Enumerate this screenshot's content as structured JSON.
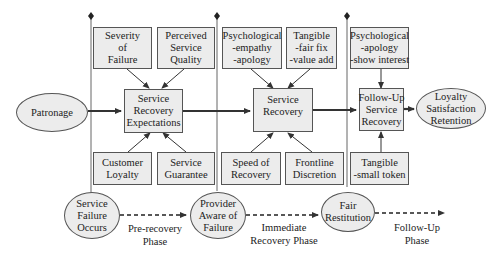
{
  "diagram": {
    "left_node": {
      "id": "patronage",
      "lines": [
        "Patronage"
      ]
    },
    "right_node": {
      "id": "outcomes",
      "lines": [
        "Loyalty",
        "Satisfaction",
        "Retention"
      ]
    },
    "main_boxes": [
      {
        "id": "service-recovery-expectations",
        "lines": [
          "Service",
          "Recovery",
          "Expectations"
        ]
      },
      {
        "id": "service-recovery",
        "lines": [
          "Service",
          "Recovery"
        ]
      },
      {
        "id": "follow-up-service-recovery",
        "lines": [
          "Follow-Up",
          "Service",
          "Recovery"
        ]
      }
    ],
    "top_inputs": [
      {
        "id": "severity-of-failure",
        "lines": [
          "Severity",
          "of",
          "Failure"
        ]
      },
      {
        "id": "perceived-service-quality",
        "lines": [
          "Perceived",
          "Service",
          "Quality"
        ]
      },
      {
        "id": "psychological-empathy-apology",
        "lines": [
          "Psychological",
          "-empathy",
          "-apology"
        ]
      },
      {
        "id": "tangible-fair-fix-value-add",
        "lines": [
          "Tangible",
          "-fair fix",
          "-value add"
        ]
      },
      {
        "id": "psychological-apology-show-interest",
        "lines": [
          "Psychological",
          "-apology",
          "-show interest"
        ]
      }
    ],
    "bottom_inputs": [
      {
        "id": "customer-loyalty",
        "lines": [
          "Customer",
          "Loyalty"
        ]
      },
      {
        "id": "service-guarantee",
        "lines": [
          "Service",
          "Guarantee"
        ]
      },
      {
        "id": "speed-of-recovery",
        "lines": [
          "Speed of",
          "Recovery"
        ]
      },
      {
        "id": "frontline-discretion",
        "lines": [
          "Frontline",
          "Discretion"
        ]
      },
      {
        "id": "tangible-small-token",
        "lines": [
          "Tangible",
          "-small token"
        ]
      }
    ],
    "timeline_events": [
      {
        "id": "service-failure-occurs",
        "lines": [
          "Service",
          "Failure",
          "Occurs"
        ]
      },
      {
        "id": "provider-aware-of-failure",
        "lines": [
          "Provider",
          "Aware of",
          "Failure"
        ]
      },
      {
        "id": "fair-restitution",
        "lines": [
          "Fair",
          "Restitution"
        ]
      }
    ],
    "phases": [
      {
        "id": "pre-recovery-phase",
        "lines": [
          "Pre-recovery",
          "Phase"
        ]
      },
      {
        "id": "immediate-recovery-phase",
        "lines": [
          "Immediate",
          "Recovery Phase"
        ]
      },
      {
        "id": "follow-up-phase",
        "lines": [
          "Follow-Up",
          "Phase"
        ]
      }
    ],
    "colors": {
      "node_fill": "#ececec",
      "stroke": "#555555",
      "text": "#222222",
      "background": "#ffffff"
    }
  }
}
